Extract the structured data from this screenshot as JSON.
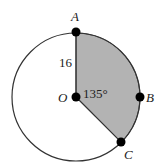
{
  "diagram": {
    "type": "circle-sector",
    "circle": {
      "cx": 76,
      "cy": 97,
      "r": 64,
      "stroke": "#333333"
    },
    "sector": {
      "fill": "#b3b3b3",
      "from_point": "A",
      "to_point": "C",
      "through_point": "B"
    },
    "points": {
      "A": {
        "label": "A",
        "x": 76,
        "y": 33
      },
      "O": {
        "label": "O",
        "x": 76,
        "y": 97
      },
      "B": {
        "label": "B",
        "x": 140,
        "y": 97
      },
      "C": {
        "label": "C",
        "x": 121,
        "y": 142
      }
    },
    "radius_label": "16",
    "angle_label": "135°"
  }
}
